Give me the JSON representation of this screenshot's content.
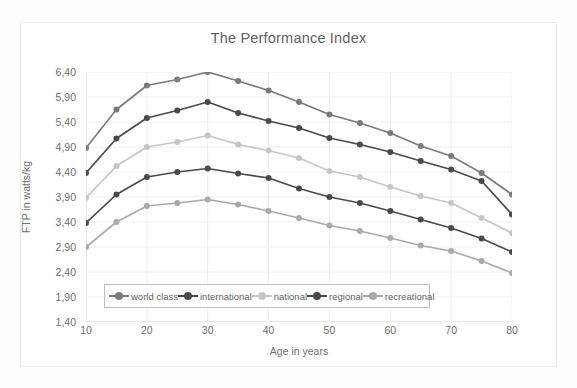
{
  "chart_data": {
    "type": "line",
    "title": "The Performance Index",
    "xlabel": "Age in years",
    "ylabel": "FTP in watts/kg",
    "x": [
      10,
      15,
      20,
      25,
      30,
      35,
      40,
      45,
      50,
      55,
      60,
      65,
      70,
      75,
      80
    ],
    "xlim": [
      10,
      80
    ],
    "xticks": [
      10,
      20,
      30,
      40,
      50,
      60,
      70,
      80
    ],
    "xtick_labels": [
      "10",
      "20",
      "30",
      "40",
      "50",
      "60",
      "70",
      "80"
    ],
    "ylim": [
      1.4,
      6.4
    ],
    "yticks": [
      1.4,
      1.9,
      2.4,
      2.9,
      3.4,
      3.9,
      4.4,
      4.9,
      5.4,
      5.9,
      6.4
    ],
    "ytick_labels": [
      "1,40",
      "1,90",
      "2,40",
      "2,90",
      "3,40",
      "3,90",
      "4,40",
      "4,90",
      "5,40",
      "5,90",
      "6,40"
    ],
    "grid": true,
    "legend_position": "inside-bottom",
    "decimal_separator": ",",
    "series": [
      {
        "name": "world class",
        "color": "#7b7b7b",
        "marker": "circle",
        "values": [
          4.88,
          5.65,
          6.13,
          6.25,
          6.4,
          6.22,
          6.03,
          5.8,
          5.55,
          5.38,
          5.18,
          4.92,
          4.72,
          4.38,
          3.95
        ]
      },
      {
        "name": "international",
        "color": "#4a4a4a",
        "marker": "circle",
        "values": [
          4.38,
          5.07,
          5.48,
          5.63,
          5.8,
          5.58,
          5.42,
          5.28,
          5.08,
          4.95,
          4.8,
          4.62,
          4.45,
          4.22,
          3.55
        ]
      },
      {
        "name": "national",
        "color": "#c6c6c6",
        "marker": "circle",
        "values": [
          3.88,
          4.52,
          4.9,
          5.0,
          5.13,
          4.95,
          4.83,
          4.68,
          4.42,
          4.3,
          4.1,
          3.92,
          3.78,
          3.48,
          3.18
        ]
      },
      {
        "name": "regional",
        "color": "#4a4a4a",
        "marker": "circle",
        "values": [
          3.38,
          3.95,
          4.3,
          4.4,
          4.47,
          4.37,
          4.28,
          4.07,
          3.9,
          3.78,
          3.62,
          3.45,
          3.28,
          3.07,
          2.8
        ]
      },
      {
        "name": "recreational",
        "color": "#aaaaaa",
        "marker": "circle",
        "values": [
          2.9,
          3.4,
          3.72,
          3.78,
          3.85,
          3.75,
          3.62,
          3.48,
          3.33,
          3.22,
          3.08,
          2.93,
          2.82,
          2.62,
          2.38
        ]
      }
    ]
  },
  "legend": {
    "items": [
      {
        "label": "world class"
      },
      {
        "label": "international"
      },
      {
        "label": "national"
      },
      {
        "label": "regional"
      },
      {
        "label": "recreational"
      }
    ]
  }
}
